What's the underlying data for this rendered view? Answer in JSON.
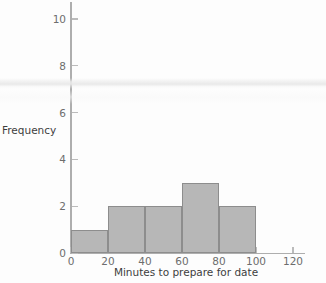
{
  "chart_data": {
    "type": "bar",
    "subtype": "histogram",
    "title": "",
    "xlabel": "Minutes to prepare for date",
    "ylabel": "Frequency",
    "xlim": [
      0,
      128
    ],
    "ylim": [
      0,
      10.8
    ],
    "grid": false,
    "legend": null,
    "bin_width": 20,
    "bin_edges": [
      0,
      20,
      40,
      60,
      80,
      100
    ],
    "categories": [
      "0-20",
      "20-40",
      "40-60",
      "60-80",
      "80-100"
    ],
    "values": [
      1,
      2,
      2,
      3,
      2
    ],
    "bars": [
      {
        "label": "0-20",
        "start": 0,
        "end": 20,
        "value": 1
      },
      {
        "label": "20-40",
        "start": 20,
        "end": 40,
        "value": 2
      },
      {
        "label": "40-60",
        "start": 40,
        "end": 60,
        "value": 2
      },
      {
        "label": "60-80",
        "start": 60,
        "end": 80,
        "value": 3
      },
      {
        "label": "80-100",
        "start": 80,
        "end": 100,
        "value": 2
      }
    ],
    "xticks": [
      0,
      20,
      40,
      60,
      80,
      100,
      120
    ],
    "xtick_labels": [
      "0",
      "20",
      "40",
      "60",
      "80",
      "100",
      "120"
    ],
    "yticks": [
      0,
      2,
      4,
      6,
      8,
      10
    ],
    "ytick_labels": [
      "0",
      "2",
      "4",
      "6",
      "8",
      "10"
    ],
    "colors": {
      "bar_fill": "#b7b7b7",
      "bar_edge": "#8d8d8d",
      "axis": "#aeaeae",
      "tick_text": "#6d6d6d",
      "title_text": "#3d3d3d",
      "background": "#fdfdfd"
    }
  }
}
